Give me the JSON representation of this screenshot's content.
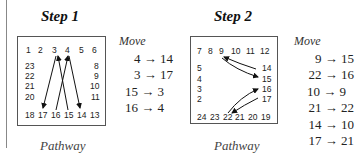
{
  "steps": [
    {
      "title": "Step 1",
      "pathway_label": "Pathway",
      "move_header": "Move",
      "moves": [
        "4 → 14",
        "3 → 17",
        "15 → 3",
        "16 → 4"
      ],
      "top_row": [
        "1",
        "2",
        "3",
        "4",
        "5",
        "6"
      ],
      "left_col": [
        "23",
        "22",
        "21",
        "20"
      ],
      "right_col": [
        "8",
        "9",
        "10",
        "11"
      ],
      "bottom_row": [
        "18",
        "17",
        "16",
        "15",
        "14",
        "13"
      ]
    },
    {
      "title": "Step 2",
      "pathway_label": "Pathway",
      "move_header": "Move",
      "moves": [
        "9 → 15",
        "22 → 16",
        "10 → 9",
        "21 → 22",
        "14 → 10",
        "17 → 21"
      ],
      "top_row": [
        "7",
        "8",
        "9",
        "10",
        "11",
        "12"
      ],
      "left_col": [
        "5",
        "4",
        "3",
        "2"
      ],
      "right_col": [
        "14",
        "15",
        "16",
        "17"
      ],
      "bottom_row": [
        "24",
        "23",
        "22",
        "21",
        "20",
        "19"
      ]
    }
  ]
}
